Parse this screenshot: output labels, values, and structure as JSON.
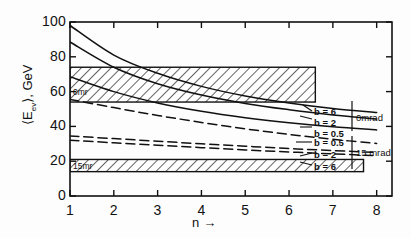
{
  "figure": {
    "title": "",
    "background": "#fdfdfd",
    "foreground": "#111111"
  },
  "axes": {
    "y_label": "⟨E",
    "y_label_sub": "ev",
    "y_label_tail": "⟩, GeV",
    "y_label_full": "⟨Eev⟩, GeV",
    "x_label": "n →",
    "x_label_text": "n",
    "x_arrow": "→"
  },
  "legend": {
    "groups": [
      {
        "name": "0mrad",
        "label": "0mrad",
        "style": "solid",
        "entries": [
          {
            "label": "b = 6",
            "b": 6
          },
          {
            "label": "b = 2",
            "b": 2
          },
          {
            "label": "b = 0.5",
            "b": 0.5
          }
        ]
      },
      {
        "name": "15mrad",
        "label": "15 mrad",
        "style": "dashed",
        "entries": [
          {
            "label": "b = 0.5",
            "b": 0.5
          },
          {
            "label": "b = 2",
            "b": 2
          },
          {
            "label": "b = 6",
            "b": 6
          }
        ]
      }
    ]
  },
  "annotations": {
    "upper_band_label": "0mr",
    "lower_band_label": "15mr"
  },
  "chart_data": {
    "type": "line",
    "title": "",
    "xlabel": "n",
    "ylabel": "<E_ev>, GeV",
    "xlim": [
      1,
      8.35
    ],
    "ylim": [
      0,
      100
    ],
    "xticks": [
      1,
      2,
      3,
      4,
      5,
      6,
      7,
      8
    ],
    "xticklabels": [
      "1",
      "2",
      "3",
      "4",
      "5",
      "6",
      "7",
      "8"
    ],
    "yticks": [
      0,
      20,
      40,
      60,
      80,
      100
    ],
    "yticklabels": [
      "0",
      "20",
      "40",
      "60",
      "80",
      "100"
    ],
    "grid": false,
    "legend_position": "right-inside",
    "x": [
      1,
      2,
      3,
      4,
      5,
      6,
      7,
      8
    ],
    "series": [
      {
        "name": "0mrad b=6",
        "group": "0mrad",
        "b": 6,
        "style": "solid",
        "color": "#111111",
        "values": [
          98.0,
          81.0,
          70.5,
          63.0,
          57.5,
          53.5,
          50.3,
          48.0
        ]
      },
      {
        "name": "0mrad b=2",
        "group": "0mrad",
        "b": 2,
        "style": "solid",
        "color": "#111111",
        "values": [
          88.5,
          74.0,
          64.5,
          58.0,
          53.2,
          49.6,
          46.6,
          44.3
        ]
      },
      {
        "name": "0mrad b=0.5",
        "group": "0mrad",
        "b": 0.5,
        "style": "solid",
        "color": "#111111",
        "values": [
          68.5,
          60.0,
          53.5,
          48.7,
          45.0,
          42.1,
          39.8,
          38.0
        ]
      },
      {
        "name": "15mrad b=0.5",
        "group": "15mrad",
        "b": 0.5,
        "style": "dashed",
        "color": "#111111",
        "values": [
          55.5,
          50.8,
          46.3,
          42.3,
          38.6,
          35.4,
          32.6,
          30.2
        ]
      },
      {
        "name": "15mrad b=2",
        "group": "15mrad",
        "b": 2,
        "style": "dashed",
        "color": "#111111",
        "values": [
          34.5,
          33.0,
          31.5,
          30.0,
          28.6,
          27.3,
          26.1,
          25.0
        ]
      },
      {
        "name": "15mrad b=6",
        "group": "15mrad",
        "b": 6,
        "style": "dashed",
        "color": "#111111",
        "values": [
          32.0,
          30.6,
          29.2,
          27.8,
          26.5,
          25.3,
          24.2,
          23.2
        ]
      }
    ],
    "bands": [
      {
        "name": "0mr",
        "label": "0mr",
        "style": "hatched",
        "y_low": 54.0,
        "y_high": 74.0,
        "x_start": 1.0,
        "x_end": 6.6
      },
      {
        "name": "15mr",
        "label": "15mr",
        "style": "hatched",
        "y_low": 14.0,
        "y_high": 21.0,
        "x_start": 1.0,
        "x_end": 7.7
      }
    ]
  }
}
